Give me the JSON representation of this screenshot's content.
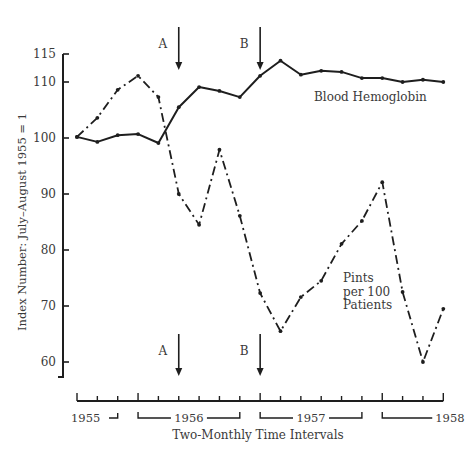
{
  "chart_data": {
    "type": "line",
    "title": "",
    "xlabel": "Two-Monthly Time Intervals",
    "ylabel": "Index Number: July–August 1955 = 1",
    "ylim": [
      57,
      115
    ],
    "yticks": [
      60,
      70,
      80,
      90,
      100,
      110,
      115
    ],
    "grid": false,
    "legend": "inline labels",
    "x": [
      1,
      2,
      3,
      4,
      5,
      6,
      7,
      8,
      9,
      10,
      11,
      12,
      13,
      14,
      15,
      16,
      17,
      18,
      19
    ],
    "year_groups": [
      {
        "label": "1955",
        "start": 1,
        "end": 3
      },
      {
        "label": "1956",
        "start": 4,
        "end": 9
      },
      {
        "label": "1957",
        "start": 10,
        "end": 15
      },
      {
        "label": "1958",
        "start": 16,
        "end": 19
      }
    ],
    "series": [
      {
        "name": "Blood Hemoglobin",
        "style": "solid",
        "values": [
          100.2,
          99.3,
          100.5,
          100.7,
          99.1,
          105.5,
          109.1,
          108.4,
          107.3,
          111.1,
          113.8,
          111.3,
          112.0,
          111.8,
          110.7,
          110.7,
          110.0,
          110.4,
          110.0
        ]
      },
      {
        "name": "Pints per 100 Patients",
        "style": "dash-dot",
        "values": [
          100.2,
          103.6,
          108.6,
          111.1,
          107.3,
          90.0,
          84.5,
          97.9,
          86.1,
          72.3,
          65.5,
          71.6,
          74.5,
          81.1,
          85.2,
          92.1,
          72.5,
          60.0,
          69.5
        ]
      }
    ],
    "annotations": [
      {
        "label": "A",
        "x": 6,
        "type": "arrow"
      },
      {
        "label": "B",
        "x": 10,
        "type": "arrow"
      }
    ],
    "series_labels": {
      "hemoglobin": [
        "Blood Hemoglobin"
      ],
      "pints": [
        "Pints",
        "per 100",
        "Patients"
      ]
    }
  }
}
